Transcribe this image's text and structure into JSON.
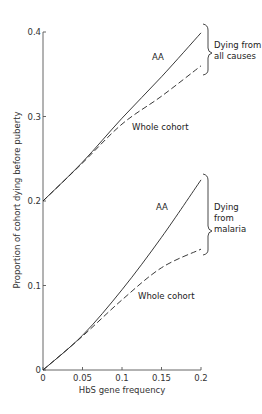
{
  "chart_data": {
    "type": "line",
    "title": "",
    "xlabel": "HbS gene frequency",
    "ylabel": "Proportion of cohort dying before puberty",
    "xlim": [
      0,
      0.2
    ],
    "ylim": [
      0,
      0.4
    ],
    "x_ticks": [
      "0",
      "0.05",
      "0.1",
      "0.15",
      "0.2"
    ],
    "y_ticks": [
      "0",
      "0.1",
      "0.2",
      "0.3",
      "0.4"
    ],
    "grid": false,
    "x": [
      0,
      0.05,
      0.1,
      0.15,
      0.2
    ],
    "series": [
      {
        "name": "AA (Dying from all causes)",
        "style": "solid",
        "values": [
          0.2,
          0.246,
          0.298,
          0.347,
          0.399
        ]
      },
      {
        "name": "Whole cohort (Dying from all causes)",
        "style": "dashed",
        "values": [
          0.2,
          0.245,
          0.291,
          0.324,
          0.36
        ]
      },
      {
        "name": "AA (Dying from malaria)",
        "style": "solid",
        "values": [
          0,
          0.041,
          0.095,
          0.157,
          0.225
        ]
      },
      {
        "name": "Whole cohort (Dying from malaria)",
        "style": "dashed",
        "values": [
          0,
          0.04,
          0.083,
          0.121,
          0.143
        ]
      }
    ],
    "annotations": {
      "upper_aa": "AA",
      "upper_whole": "Whole cohort",
      "upper_group": [
        "Dying from",
        "all causes"
      ],
      "lower_aa": "AA",
      "lower_whole": "Whole cohort",
      "lower_group": [
        "Dying",
        "from",
        "malaria"
      ]
    }
  }
}
